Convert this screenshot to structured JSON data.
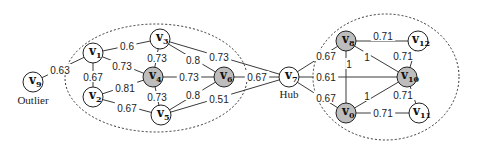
{
  "diagram": {
    "type": "weighted-graph",
    "colors": {
      "highlight_node_fill": "#bdbdbd",
      "normal_node_fill": "#ffffff",
      "stroke": "#222222"
    },
    "nodes": [
      {
        "id": "v0",
        "base": "v",
        "sub": "0",
        "x": 346,
        "y": 113,
        "highlighted": true
      },
      {
        "id": "v1",
        "base": "v",
        "sub": "1",
        "x": 93,
        "y": 53,
        "highlighted": false
      },
      {
        "id": "v2",
        "base": "v",
        "sub": "2",
        "x": 93,
        "y": 97,
        "highlighted": false
      },
      {
        "id": "v3",
        "base": "v",
        "sub": "3",
        "x": 160,
        "y": 39,
        "highlighted": false
      },
      {
        "id": "v4",
        "base": "v",
        "sub": "4",
        "x": 153,
        "y": 77,
        "highlighted": true
      },
      {
        "id": "v5",
        "base": "v",
        "sub": "5",
        "x": 161,
        "y": 115,
        "highlighted": false
      },
      {
        "id": "v6",
        "base": "v",
        "sub": "6",
        "x": 224,
        "y": 77,
        "highlighted": true
      },
      {
        "id": "v7",
        "base": "v",
        "sub": "7",
        "x": 289,
        "y": 77,
        "highlighted": false
      },
      {
        "id": "v8",
        "base": "v",
        "sub": "8",
        "x": 346,
        "y": 41,
        "highlighted": true
      },
      {
        "id": "v9",
        "base": "v",
        "sub": "9",
        "x": 33,
        "y": 82,
        "highlighted": false
      },
      {
        "id": "v10",
        "base": "v",
        "sub": "10",
        "x": 407,
        "y": 77,
        "highlighted": true
      },
      {
        "id": "v11",
        "base": "v",
        "sub": "11",
        "x": 419,
        "y": 113,
        "highlighted": false
      },
      {
        "id": "v12",
        "base": "v",
        "sub": "12",
        "x": 418,
        "y": 41,
        "highlighted": false
      }
    ],
    "edges": [
      {
        "from": "v9",
        "to": "v1",
        "weight": "0.63",
        "lx": 60,
        "ly": 70
      },
      {
        "from": "v1",
        "to": "v3",
        "weight": "0.6",
        "lx": 127,
        "ly": 46
      },
      {
        "from": "v1",
        "to": "v4",
        "weight": "0.73",
        "lx": 122,
        "ly": 66
      },
      {
        "from": "v1",
        "to": "v2",
        "weight": "0.67",
        "lx": 93,
        "ly": 77
      },
      {
        "from": "v2",
        "to": "v4",
        "weight": "0.81",
        "lx": 125,
        "ly": 88
      },
      {
        "from": "v2",
        "to": "v5",
        "weight": "0.67",
        "lx": 127,
        "ly": 108
      },
      {
        "from": "v3",
        "to": "v4",
        "weight": "0.73",
        "lx": 157,
        "ly": 58
      },
      {
        "from": "v3",
        "to": "v6",
        "weight": "0.8",
        "lx": 193,
        "ly": 60
      },
      {
        "from": "v3",
        "to": "v7",
        "weight": "0.73",
        "lx": 219,
        "ly": 57
      },
      {
        "from": "v4",
        "to": "v6",
        "weight": "0.73",
        "lx": 189,
        "ly": 77
      },
      {
        "from": "v4",
        "to": "v5",
        "weight": "0.73",
        "lx": 157,
        "ly": 97
      },
      {
        "from": "v5",
        "to": "v6",
        "weight": "0.8",
        "lx": 193,
        "ly": 95
      },
      {
        "from": "v5",
        "to": "v7",
        "weight": "0.51",
        "lx": 219,
        "ly": 99
      },
      {
        "from": "v6",
        "to": "v7",
        "weight": "0.67",
        "lx": 257,
        "ly": 77
      },
      {
        "from": "v7",
        "to": "v8",
        "weight": "0.67",
        "lx": 326,
        "ly": 56
      },
      {
        "from": "v7",
        "to": "v10",
        "weight": "0.61",
        "lx": 326,
        "ly": 77
      },
      {
        "from": "v7",
        "to": "v0",
        "weight": "0.67",
        "lx": 326,
        "ly": 98
      },
      {
        "from": "v8",
        "to": "v0",
        "weight": "1",
        "lx": 349,
        "ly": 64
      },
      {
        "from": "v8",
        "to": "v10",
        "weight": "1",
        "lx": 367,
        "ly": 57
      },
      {
        "from": "v8",
        "to": "v12",
        "weight": "0.71",
        "lx": 383,
        "ly": 36
      },
      {
        "from": "v0",
        "to": "v10",
        "weight": "1",
        "lx": 367,
        "ly": 96
      },
      {
        "from": "v0",
        "to": "v11",
        "weight": "0.71",
        "lx": 383,
        "ly": 113
      },
      {
        "from": "v10",
        "to": "v12",
        "weight": "0.71",
        "lx": 403,
        "ly": 56
      },
      {
        "from": "v10",
        "to": "v11",
        "weight": "0.71",
        "lx": 403,
        "ly": 95
      }
    ],
    "clusters": [
      {
        "id": "left-cluster",
        "cx": 156,
        "cy": 78,
        "rx": 91,
        "ry": 54
      },
      {
        "id": "right-cluster",
        "cx": 386,
        "cy": 77,
        "rx": 73,
        "ry": 63
      }
    ],
    "annotations": [
      {
        "id": "outlier",
        "text": "Outlier",
        "x": 33,
        "y": 104
      },
      {
        "id": "hub",
        "text": "Hub",
        "x": 289,
        "y": 98
      }
    ]
  }
}
